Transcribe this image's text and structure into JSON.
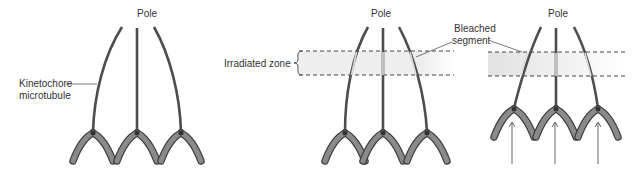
{
  "panels": [
    {
      "id": "before",
      "pole_label": "Pole",
      "microtubule_label_line1": "Kinetochore",
      "microtubule_label_line2": "microtubule"
    },
    {
      "id": "irradiated",
      "pole_label": "Pole",
      "zone_label": "Irradiated zone",
      "bleached_label_line1": "Bleached",
      "bleached_label_line2": "segment"
    },
    {
      "id": "after",
      "pole_label": "Pole"
    }
  ],
  "colors": {
    "microtubule": "#4d4d4d",
    "chromosome": "#7a7a7a",
    "chromosome_edge": "#4a4a4a",
    "zone_fill": "#e6e6e6",
    "dashed_line": "#444444",
    "bleached": "#d9d9d9"
  }
}
